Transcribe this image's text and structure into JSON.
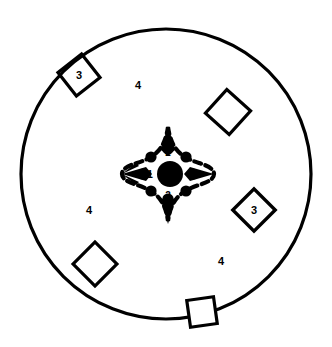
{
  "figure": {
    "background_color": "#ffffff",
    "ink_color": "#000000",
    "width": 332,
    "height": 347
  },
  "outer_boundary": {
    "name": "outer-circle",
    "shape": "circle",
    "center_x": 166,
    "center_y": 174,
    "radius": 145,
    "stroke_width": 3.2
  },
  "center_assembly": {
    "name": "four-point-star-cluster",
    "center_x": 168,
    "center_y": 174,
    "core_disc": {
      "label": "1",
      "radius": 13,
      "filled": true
    },
    "ring_dots": {
      "count": 8,
      "radius": 5.6,
      "orbit_radius": 25,
      "filled": true
    },
    "labels": [
      {
        "text": "1",
        "x": 150,
        "y": 174
      },
      {
        "text": "2",
        "x": 168,
        "y": 153
      },
      {
        "text": "2",
        "x": 168,
        "y": 196
      }
    ],
    "star_points": 4,
    "star_outline_style": "dashed"
  },
  "squares": [
    {
      "name": "square-top-left",
      "label": "3",
      "cx": 79,
      "cy": 75,
      "size": 30,
      "rotation": -38
    },
    {
      "name": "square-top-right",
      "label": "",
      "cx": 228,
      "cy": 112,
      "size": 32,
      "rotation": -48
    },
    {
      "name": "square-right",
      "label": "3",
      "cx": 254,
      "cy": 210,
      "size": 30,
      "rotation": -45
    },
    {
      "name": "square-bottom-left",
      "label": "",
      "cx": 95,
      "cy": 264,
      "size": 31,
      "rotation": -45
    },
    {
      "name": "square-bottom-edge",
      "label": "",
      "cx": 202,
      "cy": 312,
      "size": 27,
      "rotation": -8
    }
  ],
  "region_labels": [
    {
      "name": "region-label-top",
      "text": "4",
      "x": 138,
      "y": 85
    },
    {
      "name": "region-label-lower-left",
      "text": "4",
      "x": 89,
      "y": 210
    },
    {
      "name": "region-label-lower-right",
      "text": "4",
      "x": 221,
      "y": 261
    }
  ],
  "legend": {
    "items": [
      {
        "key": "1",
        "meaning": "1"
      },
      {
        "key": "2",
        "meaning": "2"
      },
      {
        "key": "3",
        "meaning": "3"
      },
      {
        "key": "4",
        "meaning": "4"
      }
    ]
  }
}
